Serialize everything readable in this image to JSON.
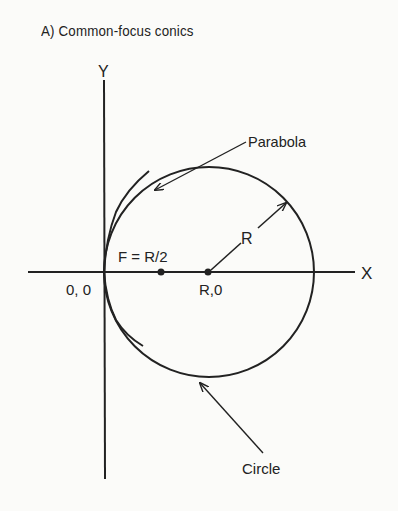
{
  "diagram": {
    "title": "A) Common-focus conics",
    "axes": {
      "x_label": "X",
      "y_label": "Y"
    },
    "labels": {
      "origin": "0, 0",
      "focus": "F = R/2",
      "center": "R,0",
      "radius": "R",
      "parabola": "Parabola",
      "circle": "Circle"
    },
    "colors": {
      "ink": "#222222",
      "background": "#fbfbf9"
    }
  }
}
